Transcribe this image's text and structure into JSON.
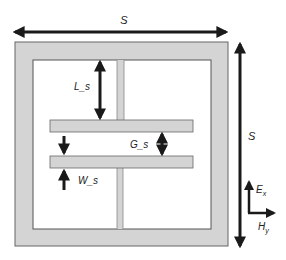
{
  "diagram": {
    "colors": {
      "metal_fill": "#d4d4d4",
      "edge": "#555555",
      "arrow": "#1a1a1a",
      "background": "#ffffff"
    },
    "labels": {
      "top_dimension": "S",
      "right_dimension": "S",
      "stub_length": "L_s",
      "gap": "G_s",
      "width": "W_s",
      "field_e": "E",
      "field_e_sub": "x",
      "field_h": "H",
      "field_h_sub": "y"
    }
  }
}
